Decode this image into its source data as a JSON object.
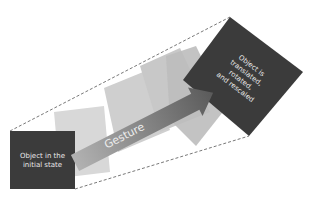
{
  "diagram": {
    "initial_state_label_line1": "Object in the",
    "initial_state_label_line2": "initial state",
    "gesture_label": "Gesture",
    "final_state_label_line1": "Object is",
    "final_state_label_line2": "translated,",
    "final_state_label_line3": "rotated,",
    "final_state_label_line4": "and rescaled",
    "colors": {
      "dark_square": "#3b3b3b",
      "intermediate_light": "#d6d6d6",
      "intermediate_mid": "#bfbfbf",
      "intermediate_dark": "#a9a9a9",
      "arrow_start": "#a8a8a8",
      "arrow_end": "#555555",
      "dashed_line": "#555555",
      "label_text": "#e8e8e8"
    }
  }
}
